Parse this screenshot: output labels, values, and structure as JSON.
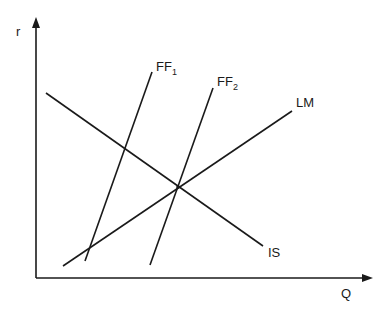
{
  "diagram": {
    "title": "",
    "axes": {
      "y_label": "r",
      "x_label": "Q"
    },
    "curves": [
      {
        "id": "IS",
        "label": "IS",
        "subscript": "",
        "slope": "negative"
      },
      {
        "id": "LM",
        "label": "LM",
        "subscript": "",
        "slope": "positive"
      },
      {
        "id": "FF1",
        "label": "FF",
        "subscript": "1",
        "slope": "steep positive"
      },
      {
        "id": "FF2",
        "label": "FF",
        "subscript": "2",
        "slope": "steep positive"
      }
    ],
    "intersections": [
      {
        "curves": [
          "IS",
          "LM",
          "FF2"
        ],
        "note": "common equilibrium point"
      },
      {
        "curves": [
          "FF1",
          "LM"
        ],
        "note": "lower-left intersection"
      },
      {
        "curves": [
          "FF1",
          "IS"
        ],
        "note": "upper-left intersection"
      }
    ],
    "colors": {
      "line": "#1a1a1a",
      "background": "#ffffff"
    }
  }
}
